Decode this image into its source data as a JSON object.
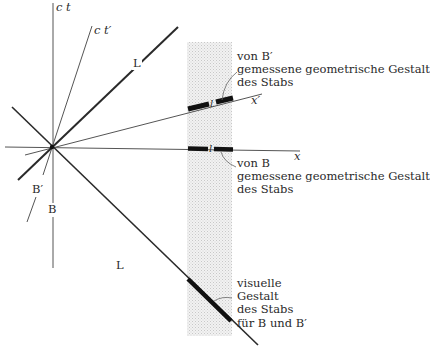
{
  "diagram": {
    "type": "spacetime-diagram",
    "axes": {
      "ct": "c t",
      "ct_prime": "c t′",
      "x": "x",
      "x_prime": "x′"
    },
    "worldlines": {
      "light_upper": "L",
      "light_lower": "L",
      "observer_B": "B",
      "observer_B_prime": "B′"
    },
    "rod_length_symbol": "l",
    "annotations": {
      "measured_by_B_prime": [
        "von B′",
        "gemessene geometrische Gestalt",
        "des Stabs"
      ],
      "measured_by_B": [
        "von B",
        "gemessene geometrische Gestalt",
        "des Stabs"
      ],
      "visual_shape": [
        "visuelle",
        "Gestalt",
        "des Stabs",
        "für B und B′"
      ]
    },
    "colors": {
      "line": "#2a2a2a",
      "band": "#e6e6e6",
      "background": "#ffffff"
    }
  }
}
